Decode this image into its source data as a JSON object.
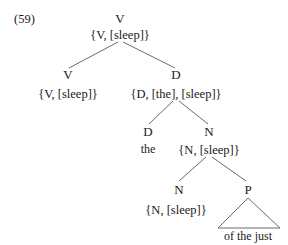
{
  "figure": {
    "example_number": "(59)",
    "type": "syntax-tree"
  },
  "nodes": {
    "root": {
      "category": "V",
      "features": "{V, [sleep]}"
    },
    "verb_left": {
      "category": "V",
      "features": "{V, [sleep]}"
    },
    "det_phrase": {
      "category": "D",
      "features": "{D, [the], [sleep]}"
    },
    "det_head": {
      "category": "D",
      "word": "the"
    },
    "noun_phrase": {
      "category": "N",
      "features": "{N, [sleep]}"
    },
    "noun_head": {
      "category": "N",
      "features": "{N, [sleep]}"
    },
    "prep_phrase": {
      "category": "P",
      "word": "of the just"
    }
  },
  "colors": {
    "background": "#ffffff",
    "text": "#1a1a1a",
    "branch_line": "#555a5e"
  }
}
